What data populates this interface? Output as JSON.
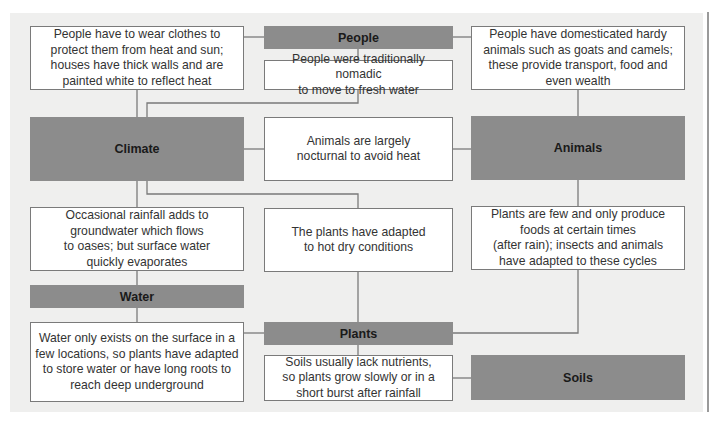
{
  "categories": {
    "people": "People",
    "climate": "Climate",
    "animals": "Animals",
    "water": "Water",
    "plants": "Plants",
    "soils": "Soils"
  },
  "notes": {
    "clothes": "People have to wear clothes to\nprotect them from heat and sun;\nhouses have thick walls and are\npainted white to reflect heat",
    "nomadic": "People were traditionally nomadic\nto move to fresh water",
    "domesticated": "People have domesticated hardy\nanimals such as goats and camels;\nthese provide transport, food and\neven wealth",
    "nocturnal": "Animals are largely\nnocturnal to avoid heat",
    "rainfall": "Occasional rainfall adds to\ngroundwater which flows\nto oases; but surface water\nquickly evaporates",
    "plants_adapted": "The plants have adapted\nto hot dry conditions",
    "plants_few": "Plants are few and only produce\nfoods at certain times\n(after rain); insects and animals\nhave adapted to these cycles",
    "water_surface": "Water only exists on the surface in a\nfew locations, so plants have adapted\nto store water or have long roots to\nreach deep underground",
    "soils_nutrients": "Soils usually lack nutrients,\nso plants grow slowly or in a\nshort burst after rainfall"
  },
  "colors": {
    "panel_bg": "#efefee",
    "category_fill": "#8c8c8c",
    "line": "#7a7a7a",
    "note_fill": "#ffffff"
  }
}
